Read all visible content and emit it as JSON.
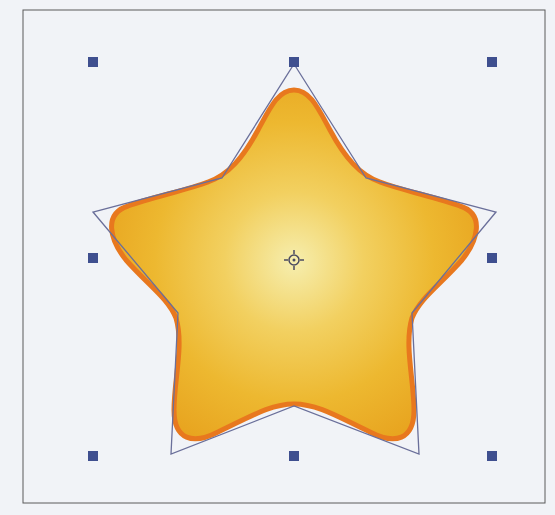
{
  "canvas": {
    "background": "#f1f3f7",
    "frame": {
      "x": 23,
      "y": 10,
      "width": 522,
      "height": 493,
      "stroke": "#5a5a5a"
    }
  },
  "shape": {
    "type": "rounded-star",
    "fill_center": "#f5eaa0",
    "fill_mid": "#f0c040",
    "fill_edge": "#eaa820",
    "stroke": "#e8781e",
    "center": {
      "x": 294,
      "y": 260
    }
  },
  "outline": {
    "stroke": "#6a6f9a",
    "points": [
      [
        294,
        64
      ],
      [
        366,
        178
      ],
      [
        496,
        212
      ],
      [
        412,
        313
      ],
      [
        419,
        454
      ],
      [
        294,
        406
      ],
      [
        171,
        454
      ],
      [
        178,
        313
      ],
      [
        93,
        212
      ],
      [
        222,
        178
      ]
    ]
  },
  "handles": {
    "color": "#3f4f8f",
    "size": 10,
    "positions": [
      {
        "name": "top-left",
        "x": 93,
        "y": 62
      },
      {
        "name": "top-center",
        "x": 294,
        "y": 62
      },
      {
        "name": "top-right",
        "x": 492,
        "y": 62
      },
      {
        "name": "middle-left",
        "x": 93,
        "y": 258
      },
      {
        "name": "middle-right",
        "x": 492,
        "y": 258
      },
      {
        "name": "bottom-left",
        "x": 93,
        "y": 456
      },
      {
        "name": "bottom-center",
        "x": 294,
        "y": 456
      },
      {
        "name": "bottom-right",
        "x": 492,
        "y": 456
      }
    ]
  },
  "center_marker": {
    "x": 294,
    "y": 260,
    "color": "#4a4a60"
  }
}
